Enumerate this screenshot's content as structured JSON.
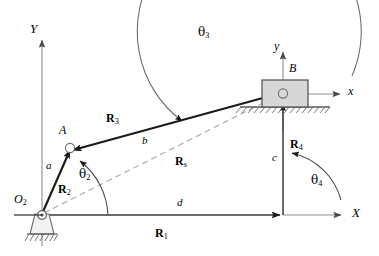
{
  "figure": {
    "type": "kinematic-diagram",
    "background": "#ffffff",
    "stroke_color": "#1a1a1a",
    "dashed_color": "#9a9a9a",
    "slider_fill": "#d6d6d6",
    "axis_color": "#808080"
  },
  "axes": {
    "global_x_label": "X",
    "global_y_label": "Y",
    "local_x_label": "x",
    "local_y_label": "y"
  },
  "points": {
    "pivot_ground": "O",
    "pivot_ground_sub": "2",
    "joint_a": "A",
    "joint_b": "B"
  },
  "vectors": [
    {
      "name": "R",
      "sub": "1",
      "label": "R1",
      "desc": "ground link vector along X axis"
    },
    {
      "name": "R",
      "sub": "2",
      "label": "R2",
      "desc": "crank vector from O2 to A"
    },
    {
      "name": "R",
      "sub": "3",
      "label": "R3",
      "desc": "coupler vector from B to A"
    },
    {
      "name": "R",
      "sub": "4",
      "label": "R4",
      "desc": "slider offset vector, vertical"
    },
    {
      "name": "R",
      "sub": "s",
      "label": "Rs",
      "desc": "dashed vector from O2 to B"
    }
  ],
  "lengths": {
    "crank": "a",
    "coupler": "b",
    "offset": "c",
    "ground": "d"
  },
  "angles": [
    {
      "symbol": "θ",
      "sub": "2",
      "desc": "crank angle measured from X axis to R2"
    },
    {
      "symbol": "θ",
      "sub": "3",
      "desc": "coupler angle measured from x axis to R3"
    },
    {
      "symbol": "θ",
      "sub": "4",
      "desc": "slider offset angle measured from X axis to R4"
    }
  ]
}
